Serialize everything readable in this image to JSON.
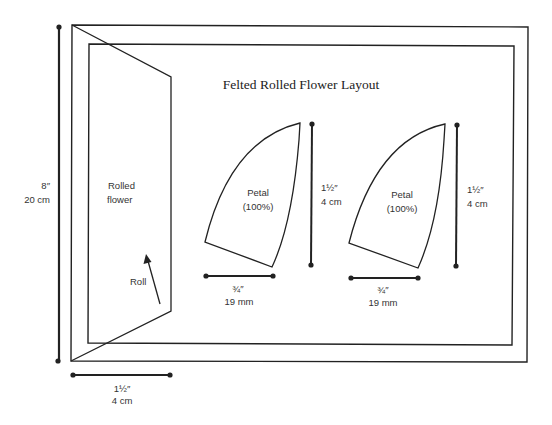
{
  "title": "Felted Rolled Flower Layout",
  "colors": {
    "line": "#222222",
    "text": "#333333",
    "background": "#ffffff"
  },
  "rolled_flower": {
    "label_line1": "Rolled",
    "label_line2": "flower",
    "roll_label": "Roll"
  },
  "dimensions": {
    "height": {
      "imperial": "8″",
      "metric": "20 cm"
    },
    "base_width": {
      "imperial": "1½″",
      "metric": "4 cm"
    }
  },
  "petals": [
    {
      "label_line1": "Petal",
      "label_line2": "(100%)",
      "height": {
        "imperial": "1½″",
        "metric": "4 cm"
      },
      "width": {
        "imperial": "¾″",
        "metric": "19 mm"
      }
    },
    {
      "label_line1": "Petal",
      "label_line2": "(100%)",
      "height": {
        "imperial": "1½″",
        "metric": "4 cm"
      },
      "width": {
        "imperial": "¾″",
        "metric": "19 mm"
      }
    }
  ]
}
